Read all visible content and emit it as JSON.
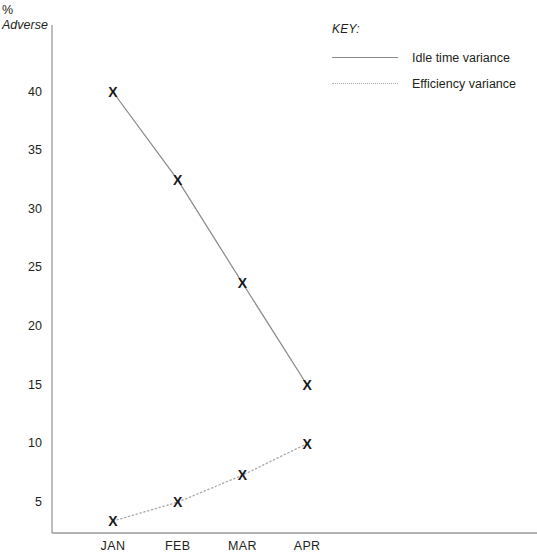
{
  "chart_data": {
    "type": "line",
    "title": "",
    "subtitle": "",
    "xlabel": "",
    "ylabel": "% Adverse",
    "ylabel_lines": [
      "%",
      "Adverse"
    ],
    "categories": [
      "JAN",
      "FEB",
      "MAR",
      "APR"
    ],
    "ylim": [
      0,
      42
    ],
    "yticks": [
      5,
      10,
      15,
      20,
      25,
      30,
      35,
      40
    ],
    "ytick_labels": [
      "5",
      "10",
      "15",
      "20",
      "25",
      "30",
      "35",
      "40"
    ],
    "grid": false,
    "legend_position": "top-right",
    "series": [
      {
        "name": "Idle time variance",
        "style": "solid",
        "color": "#8a8a8a",
        "marker": "X",
        "values": [
          40,
          32.5,
          23.7,
          15
        ]
      },
      {
        "name": "Efficiency variance",
        "style": "dotted",
        "color": "#a8a8a8",
        "marker": "X",
        "values": [
          3.4,
          5,
          7.3,
          10
        ]
      }
    ]
  },
  "legend": {
    "title": "KEY:",
    "entries": [
      {
        "label": "Idle time variance",
        "style": "solid"
      },
      {
        "label": "Efficiency variance",
        "style": "dotted"
      }
    ]
  },
  "axis": {
    "y_unit_label": "%",
    "y_direction_label": "Adverse",
    "x_categories": [
      "JAN",
      "FEB",
      "MAR",
      "APR"
    ],
    "y_tick_labels": [
      "40",
      "35",
      "30",
      "25",
      "20",
      "15",
      "10",
      "5"
    ]
  },
  "colors": {
    "axis": "#9a9a9a",
    "series_idle": "#8a8a8a",
    "series_efficiency": "#a8a8a8",
    "marker": "#1a1a1a",
    "text": "#231f20",
    "background": "#ffffff"
  }
}
